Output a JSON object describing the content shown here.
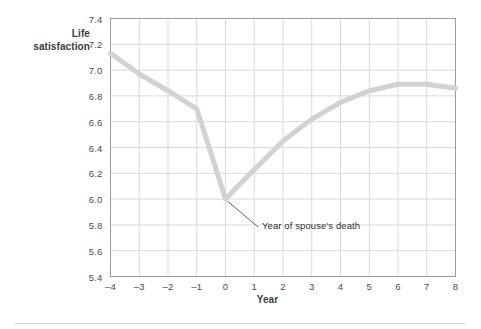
{
  "figure": {
    "background": "#ffffff",
    "plot_border_color": "#9a9aa0",
    "gridline_color": "#d9d9de",
    "line_color": "#d2d2d4",
    "annotation_leader_color": "#4d4d55",
    "tick_text_color": "#4a4a52",
    "axis_title_color": "#3b3b42"
  },
  "axis_titles": {
    "y_line1": "Life",
    "y_line2": "satisfaction",
    "x": "Year"
  },
  "annotation": {
    "label": "Year of spouse's death",
    "target_x": 0,
    "target_y": 6.0
  },
  "chart_data": {
    "type": "line",
    "title": "",
    "xlabel": "Year",
    "ylabel": "Life satisfaction",
    "xlim": [
      -4,
      8
    ],
    "ylim": [
      5.4,
      7.4
    ],
    "grid": true,
    "legend": "none",
    "x_ticks": [
      -4,
      -3,
      -2,
      -1,
      0,
      1,
      2,
      3,
      4,
      5,
      6,
      7,
      8
    ],
    "x_tick_labels": [
      "–4",
      "–3",
      "–2",
      "–1",
      "0",
      "1",
      "2",
      "3",
      "4",
      "5",
      "6",
      "7",
      "8"
    ],
    "y_ticks": [
      5.4,
      5.6,
      5.8,
      6.0,
      6.2,
      6.4,
      6.6,
      6.8,
      7.0,
      7.2,
      7.4
    ],
    "y_tick_labels": [
      "5.4",
      "5.6",
      "5.8",
      "6.0",
      "6.2",
      "6.4",
      "6.6",
      "6.8",
      "7.0",
      "7.2",
      "7.4"
    ],
    "x": [
      -4,
      -3,
      -2,
      -1,
      0,
      1,
      2,
      3,
      4,
      5,
      6,
      7,
      8
    ],
    "values": [
      7.13,
      6.97,
      6.84,
      6.7,
      6.0,
      6.23,
      6.45,
      6.62,
      6.75,
      6.84,
      6.89,
      6.89,
      6.86
    ],
    "series": [
      {
        "name": "Life satisfaction",
        "values": [
          7.13,
          6.97,
          6.84,
          6.7,
          6.0,
          6.23,
          6.45,
          6.62,
          6.75,
          6.84,
          6.89,
          6.89,
          6.86
        ]
      }
    ],
    "annotations": [
      {
        "text": "Year of spouse's death",
        "x": 0,
        "y": 6.0
      }
    ]
  }
}
